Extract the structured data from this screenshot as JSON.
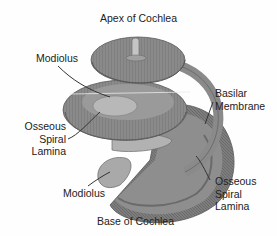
{
  "diagram": {
    "title_top": "Apex of Cochlea",
    "title_bottom": "Base of Cochlea",
    "labels": {
      "modiolus_upper": "Modiolus",
      "osseous_left": [
        "Osseous",
        "Spiral",
        "Lamina"
      ],
      "basilar": [
        "Basilar",
        "Membrane"
      ],
      "modiolus_lower": "Modiolus",
      "osseous_right": [
        "Osseous",
        "Spiral",
        "Lamina"
      ]
    },
    "colors": {
      "background": "#fefefe",
      "tissue_dark": "#6e6e6e",
      "tissue_mid": "#8c8c8c",
      "tissue_light": "#b4b4b4",
      "leader_line": "#333333",
      "text": "#222222"
    }
  }
}
